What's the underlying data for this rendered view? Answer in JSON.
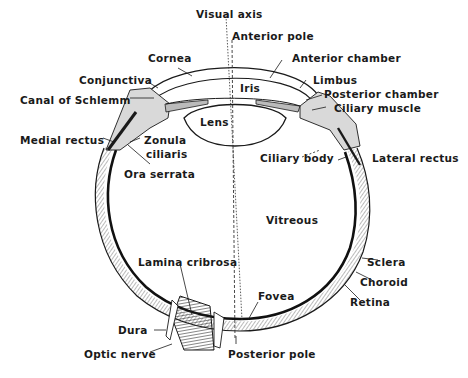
{
  "diagram": {
    "labels": {
      "visual_axis": "Visual axis",
      "anterior_pole": "Anterior pole",
      "cornea": "Cornea",
      "anterior_chamber": "Anterior chamber",
      "conjunctiva": "Conjunctiva",
      "limbus": "Limbus",
      "canal_of_schlemm": "Canal of Schlemm",
      "iris": "Iris",
      "posterior_chamber": "Posterior chamber",
      "ciliary_muscle": "Ciliary muscle",
      "lens": "Lens",
      "medial_rectus": "Medial rectus",
      "zonula": "Zonula",
      "ciliaris": "ciliaris",
      "ciliary_body": "Ciliary body",
      "lateral_rectus": "Lateral rectus",
      "ora_serrata": "Ora serrata",
      "vitreous": "Vitreous",
      "sclera": "Sclera",
      "choroid": "Choroid",
      "retina": "Retina",
      "lamina_cribrosa": "Lamina cribrosa",
      "fovea": "Fovea",
      "dura": "Dura",
      "optic_nerve": "Optic nerve",
      "posterior_pole": "Posterior pole"
    },
    "colors": {
      "ink": "#1a1a1a",
      "hatch": "#555555",
      "tissue_fill": "#d9d9d9",
      "background": "#ffffff"
    }
  }
}
